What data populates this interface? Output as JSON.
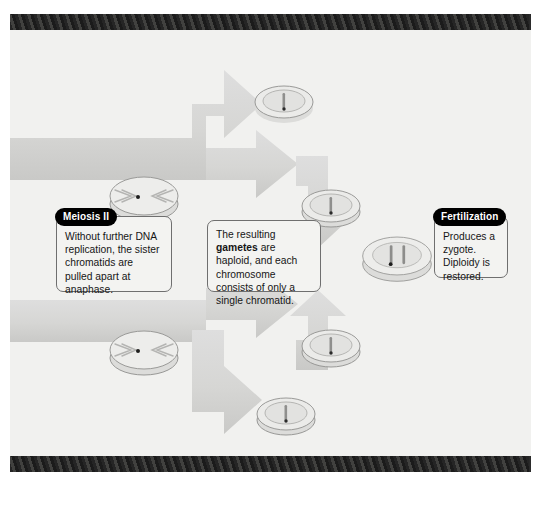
{
  "figure": {
    "background_color": "#f1f1ef",
    "frame_color": "#222222",
    "arrow_color": "#d8d8d6",
    "cell_fill": "#e9e9e7",
    "cell_stroke": "#9a9a98"
  },
  "callouts": [
    {
      "id": "meiosis-ii",
      "tab_label": "Meiosis II",
      "has_tab": true,
      "body": "Without further DNA replication, the sister chromatids are pulled apart at anaphase."
    },
    {
      "id": "gametes",
      "tab_label": "",
      "has_tab": false,
      "body_prefix": "The resulting ",
      "body_bold": "gametes",
      "body_suffix": " are haploid, and each chromosome consists of only a single chromatid."
    },
    {
      "id": "fertilization",
      "tab_label": "Fertilization",
      "has_tab": true,
      "body": "Produces a zygote. Diploidy is restored."
    }
  ],
  "cells": [
    {
      "id": "anaphase-upper",
      "stage": "anaphase-II",
      "chromatids": 2,
      "spindles": true
    },
    {
      "id": "anaphase-lower",
      "stage": "anaphase-II",
      "chromatids": 2,
      "spindles": true
    },
    {
      "id": "gamete-top",
      "stage": "haploid-gamete",
      "chromatids": 1,
      "spindles": false
    },
    {
      "id": "gamete-upper-mid",
      "stage": "haploid-gamete",
      "chromatids": 1,
      "spindles": false
    },
    {
      "id": "gamete-lower-mid",
      "stage": "haploid-gamete",
      "chromatids": 1,
      "spindles": false
    },
    {
      "id": "gamete-bottom",
      "stage": "haploid-gamete",
      "chromatids": 1,
      "spindles": false
    },
    {
      "id": "zygote",
      "stage": "diploid-zygote",
      "chromatids": 2,
      "spindles": false
    }
  ]
}
